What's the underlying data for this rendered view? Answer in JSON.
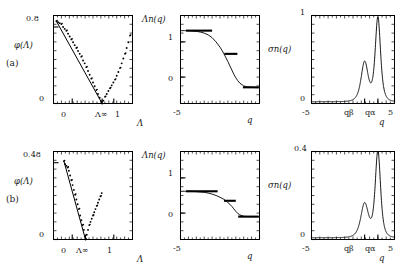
{
  "figure": {
    "width": 407,
    "height": 271,
    "background": "#ffffff",
    "ink": "#000000",
    "rows": [
      {
        "id": "a",
        "label": "(a)",
        "panels": [
          {
            "id": "i",
            "panel_label": "(i)",
            "ylabel": "φ(Λ)",
            "xlabel": "Λ",
            "ytick_labels": [
              "0",
              "0.8"
            ],
            "xtick_labels": [
              "0",
              "Λ∞",
              "1"
            ],
            "annotations": [
              "sα",
              "sβ"
            ]
          },
          {
            "id": "ii",
            "panel_label": "(ii)",
            "ylabel": "Λn(q)",
            "xlabel": "q",
            "ytick_labels": [
              "0",
              "1"
            ],
            "xtick_labels": [
              "-5",
              "5"
            ]
          },
          {
            "id": "iii",
            "panel_label": "(iii)",
            "ylabel": "σn(q)",
            "xlabel": "q",
            "ytick_labels": [
              "0",
              "1"
            ],
            "xtick_labels": [
              "-5",
              "qβ",
              "qα",
              "5"
            ]
          }
        ]
      },
      {
        "id": "b",
        "label": "(b)",
        "panels": [
          {
            "id": "i",
            "panel_label": "(i)",
            "ylabel": "φ(Λ)",
            "xlabel": "Λ",
            "ytick_labels": [
              "0",
              "0.48"
            ],
            "xtick_labels": [
              "0",
              "Λ∞",
              "1"
            ],
            "annotations": [
              "sα",
              "sβ"
            ]
          },
          {
            "id": "ii",
            "panel_label": "(ii)",
            "ylabel": "Λn(q)",
            "xlabel": "q",
            "ytick_labels": [
              "0",
              "1"
            ],
            "xtick_labels": [
              "-5",
              "5"
            ]
          },
          {
            "id": "iii",
            "panel_label": "(iii)",
            "ylabel": "σn(q)",
            "xlabel": "q",
            "ytick_labels": [
              "0",
              "0.4"
            ],
            "xtick_labels": [
              "-5",
              "qβ",
              "qα",
              "5"
            ]
          }
        ]
      }
    ]
  },
  "chart_data": [
    {
      "key": "a_i",
      "type": "scatter",
      "title": "(i)",
      "xlabel": "Λ",
      "ylabel": "φ(Λ)",
      "xlim": [
        -0.45,
        1.45
      ],
      "ylim": [
        0.0,
        0.92
      ],
      "xticks": [
        0,
        0.72,
        1
      ],
      "xtick_labels": [
        "0",
        "Λ∞",
        "1"
      ],
      "yticks": [
        0,
        0.8
      ],
      "ytick_labels": [
        "0",
        "0.8"
      ],
      "grid": false,
      "legend": "none",
      "annotations": [
        {
          "text": "sα",
          "x": 0.16,
          "y": 0.36
        },
        {
          "text": "sβ",
          "x": 1.02,
          "y": 0.2
        }
      ],
      "lambda_star": 0.72,
      "series": [
        {
          "name": "phi",
          "marker": "dot",
          "x": [
            -0.38,
            -0.34,
            -0.3,
            -0.26,
            -0.22,
            -0.18,
            -0.14,
            -0.1,
            -0.06,
            -0.02,
            0.02,
            0.06,
            0.1,
            0.14,
            0.18,
            0.22,
            0.26,
            0.3,
            0.34,
            0.38,
            0.42,
            0.46,
            0.5,
            0.54,
            0.58,
            0.62,
            0.66,
            0.7,
            0.72,
            0.75,
            0.79,
            0.83,
            0.87,
            0.91,
            0.95,
            0.99,
            1.03,
            1.07,
            1.11,
            1.15,
            1.19,
            1.23,
            1.27,
            1.31,
            1.35,
            1.39
          ],
          "y": [
            0.86,
            0.85,
            0.84,
            0.83,
            0.8,
            0.78,
            0.76,
            0.73,
            0.7,
            0.67,
            0.64,
            0.61,
            0.58,
            0.55,
            0.52,
            0.49,
            0.45,
            0.42,
            0.38,
            0.34,
            0.3,
            0.26,
            0.22,
            0.18,
            0.14,
            0.1,
            0.06,
            0.02,
            0.0,
            0.03,
            0.07,
            0.1,
            0.13,
            0.16,
            0.19,
            0.22,
            0.25,
            0.29,
            0.33,
            0.37,
            0.42,
            0.47,
            0.52,
            0.58,
            0.64,
            0.71
          ]
        }
      ]
    },
    {
      "key": "a_ii",
      "type": "line",
      "title": "(ii)",
      "xlabel": "q",
      "ylabel": "Λn(q)",
      "xlim": [
        -5,
        5
      ],
      "ylim": [
        -0.75,
        1.75
      ],
      "xticks": [
        -5,
        5
      ],
      "xtick_labels": [
        "-5",
        "5"
      ],
      "yticks": [
        0,
        1
      ],
      "ytick_labels": [
        "0",
        "1"
      ],
      "grid": false,
      "legend": "none",
      "series": [
        {
          "name": "Lambda_n",
          "kind": "sigmoid",
          "x": [
            -5,
            -4.5,
            -4,
            -3.5,
            -3,
            -2.5,
            -2,
            -1.5,
            -1,
            -0.5,
            0,
            0.25,
            0.5,
            0.75,
            1,
            1.25,
            1.5,
            1.75,
            2,
            2.25,
            2.5,
            3,
            3.5,
            4,
            4.5,
            5
          ],
          "y": [
            1.32,
            1.32,
            1.32,
            1.31,
            1.3,
            1.28,
            1.25,
            1.2,
            1.12,
            1.0,
            0.85,
            0.76,
            0.66,
            0.55,
            0.44,
            0.32,
            0.2,
            0.08,
            -0.02,
            -0.1,
            -0.17,
            -0.25,
            -0.28,
            -0.29,
            -0.3,
            -0.3
          ]
        },
        {
          "name": "plateau-high",
          "kind": "segment",
          "x": [
            -4.3,
            -1.0
          ],
          "y": 1.32
        },
        {
          "name": "plateau-mid",
          "kind": "segment",
          "x": [
            0.55,
            2.2
          ],
          "y": 0.66
        },
        {
          "name": "plateau-low",
          "kind": "segment",
          "x": [
            2.9,
            4.9
          ],
          "y": -0.29
        }
      ]
    },
    {
      "key": "a_iii",
      "type": "line",
      "title": "(iii)",
      "xlabel": "q",
      "ylabel": "σn(q)",
      "xlim": [
        -5,
        5
      ],
      "ylim": [
        0,
        1
      ],
      "xticks": [
        -5,
        1.4,
        3.0,
        5
      ],
      "xtick_labels": [
        "-5",
        "qβ",
        "qα",
        "5"
      ],
      "yticks": [
        0,
        1
      ],
      "ytick_labels": [
        "0",
        "1"
      ],
      "grid": false,
      "legend": "none",
      "peaks": [
        {
          "name": "q_beta",
          "center": 1.4,
          "height": 0.45,
          "width": 0.55
        },
        {
          "name": "q_alpha",
          "center": 3.0,
          "height": 0.95,
          "width": 0.42
        }
      ],
      "baseline": 0.02
    },
    {
      "key": "b_i",
      "type": "scatter",
      "title": "(i)",
      "xlabel": "Λ",
      "ylabel": "φ(Λ)",
      "xlim": [
        -0.45,
        1.45
      ],
      "ylim": [
        0.0,
        0.55
      ],
      "xticks": [
        0,
        0.32,
        1
      ],
      "xtick_labels": [
        "0",
        "Λ∞",
        "1"
      ],
      "yticks": [
        0,
        0.48
      ],
      "ytick_labels": [
        "0",
        "0.48"
      ],
      "grid": false,
      "legend": "none",
      "annotations": [
        {
          "text": "sα",
          "x": -0.1,
          "y": 0.17
        },
        {
          "text": "sβ",
          "x": 0.62,
          "y": 0.12
        }
      ],
      "lambda_star": 0.32,
      "series": [
        {
          "name": "phi",
          "marker": "dot",
          "x": [
            -0.2,
            -0.17,
            -0.14,
            -0.11,
            -0.08,
            -0.05,
            -0.02,
            0.01,
            0.04,
            0.07,
            0.1,
            0.13,
            0.16,
            0.19,
            0.22,
            0.25,
            0.28,
            0.31,
            0.32,
            0.35,
            0.38,
            0.41,
            0.44,
            0.47,
            0.5,
            0.53,
            0.56,
            0.59,
            0.62,
            0.65,
            0.68,
            0.71
          ],
          "y": [
            0.49,
            0.47,
            0.46,
            0.45,
            0.43,
            0.4,
            0.37,
            0.34,
            0.31,
            0.28,
            0.25,
            0.22,
            0.19,
            0.15,
            0.12,
            0.09,
            0.06,
            0.02,
            0.0,
            0.03,
            0.06,
            0.09,
            0.11,
            0.13,
            0.15,
            0.17,
            0.19,
            0.21,
            0.23,
            0.25,
            0.27,
            0.29
          ]
        }
      ]
    },
    {
      "key": "b_ii",
      "type": "line",
      "title": "(ii)",
      "xlabel": "q",
      "ylabel": "Λn(q)",
      "xlim": [
        -5,
        5
      ],
      "ylim": [
        -0.75,
        1.75
      ],
      "xticks": [
        -5,
        5
      ],
      "xtick_labels": [
        "-5",
        "5"
      ],
      "yticks": [
        0,
        1
      ],
      "ytick_labels": [
        "0",
        "1"
      ],
      "grid": false,
      "legend": "none",
      "series": [
        {
          "name": "Lambda_n",
          "kind": "sigmoid",
          "x": [
            -5,
            -4.5,
            -4,
            -3.5,
            -3,
            -2.5,
            -2,
            -1.5,
            -1,
            -0.5,
            0,
            0.25,
            0.5,
            0.75,
            1,
            1.25,
            1.5,
            1.75,
            2,
            2.25,
            2.5,
            3,
            3.5,
            4,
            4.5,
            5
          ],
          "y": [
            0.62,
            0.62,
            0.62,
            0.62,
            0.61,
            0.6,
            0.59,
            0.57,
            0.54,
            0.5,
            0.45,
            0.42,
            0.39,
            0.35,
            0.3,
            0.25,
            0.19,
            0.12,
            0.05,
            -0.01,
            -0.05,
            -0.09,
            -0.1,
            -0.1,
            -0.1,
            -0.1
          ]
        },
        {
          "name": "plateau-high",
          "kind": "segment",
          "x": [
            -4.3,
            -0.3
          ],
          "y": 0.62
        },
        {
          "name": "plateau-mid",
          "kind": "segment",
          "x": [
            0.5,
            2.0
          ],
          "y": 0.35
        },
        {
          "name": "plateau-low",
          "kind": "segment",
          "x": [
            2.3,
            4.9
          ],
          "y": -0.1
        }
      ]
    },
    {
      "key": "b_iii",
      "type": "line",
      "title": "(iii)",
      "xlabel": "q",
      "ylabel": "σn(q)",
      "xlim": [
        -5,
        5
      ],
      "ylim": [
        0,
        0.4
      ],
      "xticks": [
        -5,
        1.4,
        3.0,
        5
      ],
      "xtick_labels": [
        "-5",
        "qβ",
        "qα",
        "5"
      ],
      "yticks": [
        0,
        0.4
      ],
      "ytick_labels": [
        "0",
        "0.4"
      ],
      "grid": false,
      "legend": "none",
      "peaks": [
        {
          "name": "q_beta",
          "center": 1.4,
          "height": 0.155,
          "width": 0.6
        },
        {
          "name": "q_alpha",
          "center": 3.0,
          "height": 0.39,
          "width": 0.42
        }
      ],
      "baseline": 0.008
    }
  ]
}
